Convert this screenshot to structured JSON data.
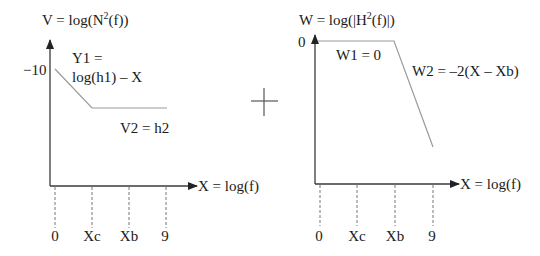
{
  "left_plot": {
    "y_axis_label": "V = log(N",
    "y_axis_sup": "2",
    "y_axis_label_end": "(f))",
    "x_axis_label": "X = log(f)",
    "y_tick_label": "−10",
    "segment1_label_line1": "Y1 =",
    "segment1_label_line2": "log(h1) – X",
    "segment2_label": "V2 = h2",
    "x_ticks": [
      "0",
      "Xc",
      "Xb",
      "9"
    ]
  },
  "operator": {
    "symbol": "plus",
    "meaning": "sum of the two plots"
  },
  "right_plot": {
    "y_axis_label": "W = log(|H",
    "y_axis_sup": "2",
    "y_axis_label_end": "(f)|)",
    "x_axis_label": "X = log(f)",
    "y_tick_label": "0",
    "segment1_label": "W1 = 0",
    "segment2_label": "W2 = –2(X – Xb)",
    "x_ticks": [
      "0",
      "Xc",
      "Xb",
      "9"
    ]
  },
  "colors": {
    "axis": "#3a3a3a",
    "curve": "#9a9a9a",
    "dashed": "#777777",
    "text": "#1a1a1a"
  }
}
